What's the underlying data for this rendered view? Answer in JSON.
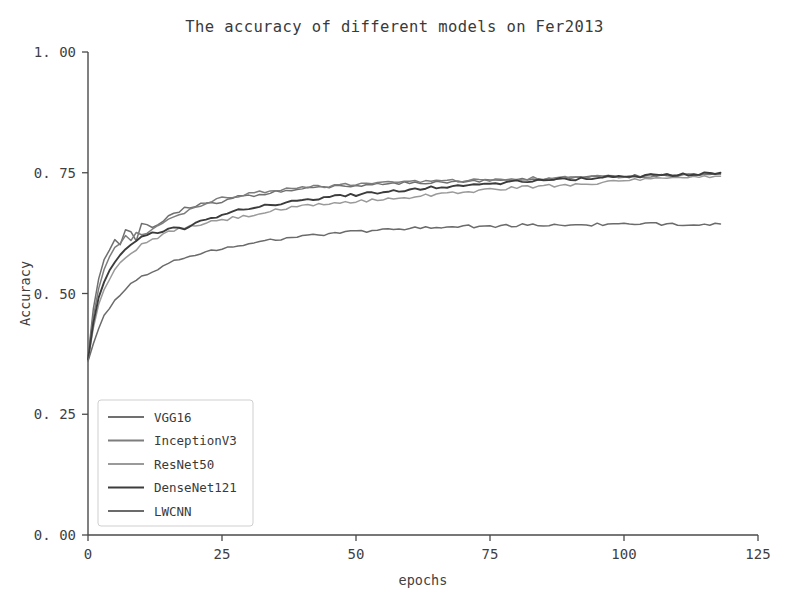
{
  "chart_data": {
    "type": "line",
    "title": "The accuracy of different models on Fer2013",
    "xlabel": "epochs",
    "ylabel": "Accuracy",
    "xlim": [
      0,
      125
    ],
    "ylim": [
      0.0,
      1.0
    ],
    "xticks": [
      0,
      25,
      50,
      75,
      100,
      125
    ],
    "xtick_labels": [
      "0",
      "25",
      "50",
      "75",
      "100",
      "125"
    ],
    "yticks": [
      0.0,
      0.25,
      0.5,
      0.75,
      1.0
    ],
    "ytick_labels": [
      "0. 00",
      "0. 25",
      "0. 50",
      "0. 75",
      "1. 00"
    ],
    "grid": false,
    "legend_position": "lower left",
    "x": [
      0,
      1,
      2,
      3,
      4,
      5,
      6,
      7,
      8,
      9,
      10,
      12,
      14,
      16,
      18,
      20,
      22,
      25,
      28,
      31,
      34,
      37,
      40,
      44,
      48,
      52,
      56,
      60,
      64,
      68,
      72,
      76,
      80,
      84,
      88,
      92,
      96,
      100,
      104,
      108,
      112,
      115,
      118
    ],
    "series": [
      {
        "name": "VGG16",
        "color": "#707070",
        "values": [
          0.368,
          0.47,
          0.53,
          0.568,
          0.592,
          0.612,
          0.602,
          0.632,
          0.625,
          0.612,
          0.642,
          0.637,
          0.652,
          0.664,
          0.676,
          0.681,
          0.686,
          0.691,
          0.7,
          0.704,
          0.709,
          0.713,
          0.716,
          0.72,
          0.722,
          0.724,
          0.727,
          0.729,
          0.73,
          0.732,
          0.733,
          0.735,
          0.736,
          0.737,
          0.739,
          0.74,
          0.741,
          0.742,
          0.744,
          0.745,
          0.746,
          0.747,
          0.748
        ]
      },
      {
        "name": "InceptionV3",
        "color": "#7d7d7d",
        "values": [
          0.366,
          0.452,
          0.512,
          0.548,
          0.575,
          0.594,
          0.606,
          0.618,
          0.612,
          0.628,
          0.62,
          0.634,
          0.646,
          0.658,
          0.668,
          0.678,
          0.686,
          0.697,
          0.703,
          0.708,
          0.712,
          0.716,
          0.719,
          0.722,
          0.725,
          0.727,
          0.729,
          0.731,
          0.732,
          0.734,
          0.735,
          0.736,
          0.738,
          0.739,
          0.74,
          0.741,
          0.742,
          0.743,
          0.744,
          0.745,
          0.746,
          0.747,
          0.747
        ]
      },
      {
        "name": "ResNet50",
        "color": "#9a9a9a",
        "values": [
          0.362,
          0.43,
          0.478,
          0.508,
          0.53,
          0.548,
          0.562,
          0.574,
          0.584,
          0.592,
          0.6,
          0.612,
          0.622,
          0.63,
          0.636,
          0.641,
          0.646,
          0.652,
          0.658,
          0.663,
          0.67,
          0.676,
          0.68,
          0.685,
          0.689,
          0.692,
          0.696,
          0.7,
          0.704,
          0.708,
          0.712,
          0.716,
          0.719,
          0.722,
          0.724,
          0.727,
          0.73,
          0.733,
          0.736,
          0.738,
          0.74,
          0.742,
          0.743
        ]
      },
      {
        "name": "DenseNet121",
        "color": "#3c3c3c",
        "values": [
          0.364,
          0.44,
          0.492,
          0.526,
          0.548,
          0.566,
          0.578,
          0.59,
          0.6,
          0.608,
          0.616,
          0.626,
          0.629,
          0.64,
          0.634,
          0.646,
          0.654,
          0.662,
          0.674,
          0.679,
          0.683,
          0.688,
          0.692,
          0.698,
          0.703,
          0.707,
          0.711,
          0.716,
          0.719,
          0.722,
          0.725,
          0.728,
          0.731,
          0.734,
          0.736,
          0.738,
          0.74,
          0.742,
          0.744,
          0.746,
          0.747,
          0.749,
          0.75
        ]
      },
      {
        "name": "LWCNN",
        "color": "#6b6b6b",
        "values": [
          0.36,
          0.396,
          0.428,
          0.452,
          0.47,
          0.486,
          0.498,
          0.508,
          0.518,
          0.526,
          0.534,
          0.547,
          0.557,
          0.566,
          0.574,
          0.58,
          0.586,
          0.594,
          0.6,
          0.605,
          0.61,
          0.615,
          0.618,
          0.623,
          0.627,
          0.63,
          0.633,
          0.635,
          0.637,
          0.638,
          0.639,
          0.64,
          0.641,
          0.641,
          0.642,
          0.642,
          0.643,
          0.643,
          0.643,
          0.644,
          0.644,
          0.644,
          0.644
        ]
      }
    ]
  },
  "legend": {
    "entries": [
      {
        "label": "VGG16"
      },
      {
        "label": "InceptionV3"
      },
      {
        "label": "ResNet50"
      },
      {
        "label": "DenseNet121"
      },
      {
        "label": "LWCNN"
      }
    ]
  }
}
